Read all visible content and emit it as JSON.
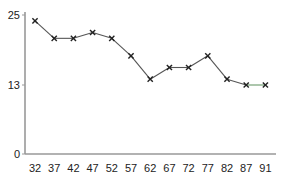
{
  "chart_data": {
    "type": "line",
    "title": "",
    "xlabel": "",
    "ylabel": "",
    "categories": [
      "32",
      "37",
      "42",
      "47",
      "52",
      "57",
      "62",
      "67",
      "72",
      "77",
      "82",
      "87",
      "91"
    ],
    "series": [
      {
        "name": "series-1",
        "marker": "x",
        "values": [
          24,
          21,
          21,
          22,
          21,
          18,
          14,
          16,
          16,
          18,
          14,
          13,
          13
        ]
      }
    ],
    "yticks": [
      0,
      13,
      25
    ],
    "ylim": [
      0,
      25
    ],
    "grid": false,
    "legend": null
  },
  "axes": {
    "y_tick_labels": [
      "25",
      "13",
      "0"
    ],
    "x_tick_labels": [
      "32",
      "37",
      "42",
      "47",
      "52",
      "57",
      "62",
      "67",
      "72",
      "77",
      "82",
      "87",
      "91"
    ]
  },
  "colors": {
    "line": "#555555",
    "last_segment": "#6a9a6a",
    "marker": "#222222",
    "axis": "#999999",
    "text": "#222222"
  }
}
